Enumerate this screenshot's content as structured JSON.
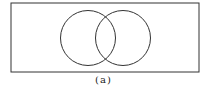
{
  "diagram": {
    "type": "venn",
    "caption": "(a)",
    "universe": {
      "x": 11,
      "y": 3,
      "width": 188,
      "height": 69
    },
    "sets": [
      {
        "name": "left-set",
        "cx": 88,
        "cy": 38,
        "r": 27.5
      },
      {
        "name": "right-set",
        "cx": 123,
        "cy": 38,
        "r": 27.5
      }
    ],
    "stroke_color": "#333333",
    "background": "#ffffff"
  }
}
